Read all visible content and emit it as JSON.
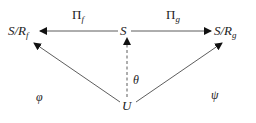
{
  "diagram": {
    "nodes": {
      "left": {
        "main": "S/R",
        "sub": "f"
      },
      "center": {
        "main": "S"
      },
      "right": {
        "main": "S/R",
        "sub": "g"
      },
      "bottom": {
        "main": "U"
      }
    },
    "edges": {
      "pi_f": {
        "main": "Π",
        "sub": "f"
      },
      "pi_g": {
        "main": "Π",
        "sub": "g"
      },
      "theta": "θ",
      "phi": "φ",
      "psi": "ψ"
    },
    "colors": {
      "line": "#333333",
      "text": "#222222"
    }
  }
}
